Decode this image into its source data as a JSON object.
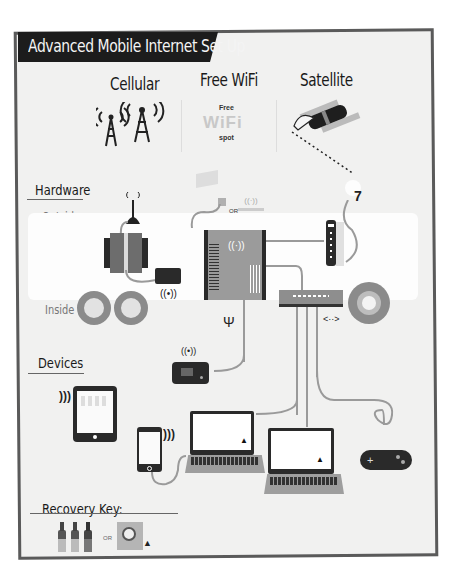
{
  "title": "Advanced Mobile Internet Set Up",
  "sources": [
    {
      "label": "Cellular",
      "icon": "cell-tower-icon"
    },
    {
      "label": "Free WiFi",
      "icon": "wifi-hotspot-icon",
      "badge_top": "Free",
      "badge_main": "WiFi",
      "badge_bottom": "spot"
    },
    {
      "label": "Satellite",
      "icon": "satellite-icon"
    }
  ],
  "hardware": {
    "title": "Hardware",
    "outside_label": "Outside",
    "inside_label": "Inside",
    "or_label": "OR",
    "usb_symbol": "Ψ",
    "link_symbol": "<··>"
  },
  "devices": {
    "title": "Devices"
  },
  "recovery": {
    "title": "Recovery Key:",
    "or_label": "OR"
  },
  "colors": {
    "frame": "#5a5a5a",
    "banner": "#1c1c1c",
    "background": "#f1f1f0",
    "device_dark": "#2a2a2a",
    "wire": "#9a9a9a",
    "accent_gray": "#8a8a8a"
  }
}
